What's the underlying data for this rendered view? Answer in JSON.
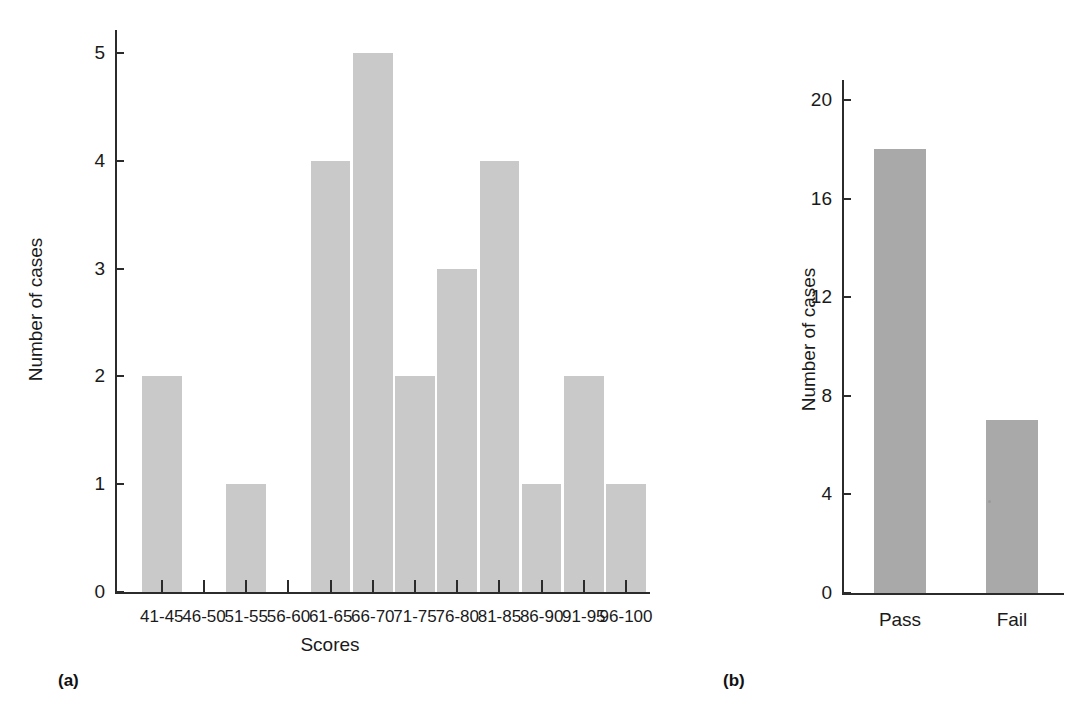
{
  "figure_a": {
    "panel_label": "(a)",
    "ylabel": "Number of cases",
    "xlabel": "Scores",
    "y_ticks": [
      "0",
      "1",
      "2",
      "3",
      "4",
      "5"
    ],
    "x_ticks": [
      "41-45",
      "46-50",
      "51-55",
      "56-60",
      "61-65",
      "66-70",
      "71-75",
      "76-80",
      "81-85",
      "86-90",
      "91-95",
      "96-100"
    ],
    "bar_color": "#c9c9c9"
  },
  "figure_b": {
    "panel_label": "(b)",
    "ylabel": "Number of cases",
    "xlabel": "",
    "y_ticks": [
      "0",
      "4",
      "8",
      "12",
      "16",
      "20"
    ],
    "x_ticks": [
      "Pass",
      "Fail"
    ],
    "bar_color": "#a9a9a9"
  },
  "chart_data": [
    {
      "type": "bar",
      "id": "a",
      "title": "",
      "subtitle": "",
      "panel_label": "(a)",
      "categories": [
        "41-45",
        "46-50",
        "51-55",
        "56-60",
        "61-65",
        "66-70",
        "71-75",
        "76-80",
        "81-85",
        "86-90",
        "91-95",
        "96-100"
      ],
      "values": [
        2,
        0,
        1,
        0,
        4,
        5,
        2,
        3,
        4,
        1,
        2,
        1
      ],
      "xlabel": "Scores",
      "ylabel": "Number of cases",
      "ylim": [
        0,
        5
      ],
      "yticks": [
        0,
        1,
        2,
        3,
        4,
        5
      ],
      "grid": false,
      "legend": "none",
      "bar_color": "#c9c9c9",
      "notes": "Histogram of scores; contiguous bins separated by thin white gaps; bins 46-50 and 56-60 are empty"
    },
    {
      "type": "bar",
      "id": "b",
      "title": "",
      "subtitle": "",
      "panel_label": "(b)",
      "categories": [
        "Pass",
        "Fail"
      ],
      "values": [
        18,
        7
      ],
      "xlabel": "",
      "ylabel": "Number of cases",
      "ylim": [
        0,
        20
      ],
      "yticks": [
        0,
        4,
        8,
        12,
        16,
        20
      ],
      "grid": false,
      "legend": "none",
      "bar_color": "#a9a9a9",
      "notes": "Two separated bars; no x-axis tick marks, only category labels"
    }
  ]
}
